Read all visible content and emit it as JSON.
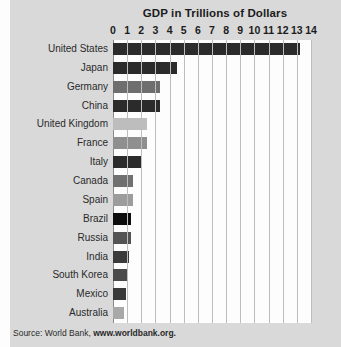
{
  "chart_data": {
    "type": "bar",
    "orientation": "horizontal",
    "title": "GDP in Trillions of Dollars",
    "xlabel": "",
    "ylabel": "",
    "xlim": [
      0,
      14
    ],
    "xticks": [
      "0",
      "1",
      "2",
      "3",
      "4",
      "5",
      "6",
      "7",
      "8",
      "9",
      "10",
      "11",
      "12",
      "13",
      "14"
    ],
    "grid": true,
    "legend": false,
    "categories": [
      "United States",
      "Japan",
      "Germany",
      "China",
      "United Kingdom",
      "France",
      "Italy",
      "Canada",
      "Spain",
      "Brazil",
      "Russia",
      "India",
      "South Korea",
      "Mexico",
      "Australia"
    ],
    "values": [
      13.2,
      4.5,
      3.3,
      3.3,
      2.4,
      2.4,
      2.0,
      1.4,
      1.4,
      1.3,
      1.3,
      1.1,
      1.0,
      0.9,
      0.8
    ],
    "bar_colors": [
      "#2b2b2b",
      "#2b2b2b",
      "#6e6e6e",
      "#2b2b2b",
      "#bdbdbd",
      "#8f8f8f",
      "#2b2b2b",
      "#707070",
      "#9c9c9c",
      "#0d0d0d",
      "#545454",
      "#3b3b3b",
      "#4a4a4a",
      "#3a3a3a",
      "#a8a8a8"
    ],
    "source": {
      "prefix": "Source: World Bank, ",
      "link": "www.worldbank.org."
    }
  },
  "figure": {
    "background_color": "#d9d9d9",
    "plot_background_color": "#fdfdfd",
    "gridline_color": "#bdbdbd",
    "text_color": "#1c1c1c"
  }
}
